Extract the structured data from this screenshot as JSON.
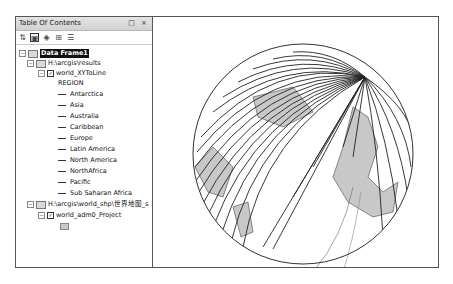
{
  "toc": {
    "title": "Table Of Contents",
    "window_controls": "□ ×",
    "toolbar": [
      {
        "icon": "list-by-drawing-order-icon",
        "glyph": "⇅"
      },
      {
        "icon": "list-by-source-icon",
        "glyph": "▣",
        "active": true
      },
      {
        "icon": "list-by-visibility-icon",
        "glyph": "◈"
      },
      {
        "icon": "list-by-selection-icon",
        "glyph": "⊞"
      },
      {
        "icon": "options-icon",
        "glyph": "☰"
      }
    ],
    "data_frame": "Data Frame1",
    "folder1": "H:\\arcgis\\results",
    "layer1": "world_XYToLine",
    "field_header": "REGION",
    "regions": [
      "Antarctica",
      "Asia",
      "Australia",
      "Caribbean",
      "Europe",
      "Latin America",
      "North America",
      "NorthAfrica",
      "Pacific",
      "Sub Saharan Africa"
    ],
    "folder2": "H:\\arcgis\\world_shp\\世界地图_s",
    "layer2": "world_adm0_Project"
  },
  "map": {
    "land_color": "#c8c8c8",
    "line_color": "#222222",
    "globe_outline": "#333333"
  }
}
